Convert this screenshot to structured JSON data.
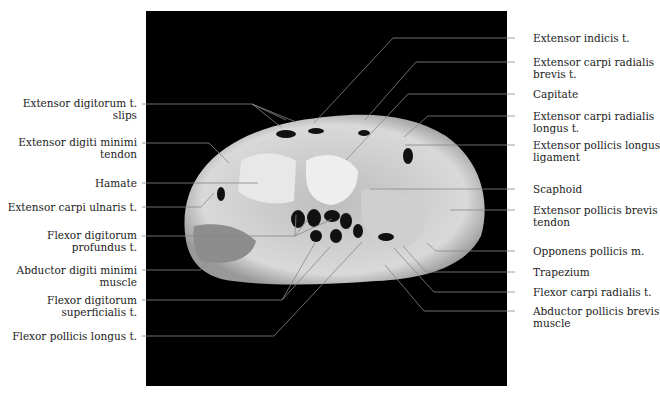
{
  "figure": {
    "type": "axial MRI of wrist (carpal level)",
    "left_labels": [
      {
        "line1": "Extensor digitorum t.",
        "line2": "slips"
      },
      {
        "line1": "Extensor digiti minimi",
        "line2": "tendon"
      },
      {
        "line1": "Hamate",
        "line2": ""
      },
      {
        "line1": "Extensor carpi ulnaris t.",
        "line2": ""
      },
      {
        "line1": "Flexor digitorum",
        "line2": "profundus t."
      },
      {
        "line1": "Abductor digiti minimi",
        "line2": "muscle"
      },
      {
        "line1": "Flexor digitorum",
        "line2": "superficialis t."
      },
      {
        "line1": "Flexor pollicis longus t.",
        "line2": ""
      }
    ],
    "right_labels": [
      {
        "line1": "Extensor indicis t.",
        "line2": ""
      },
      {
        "line1": "Extensor carpi radialis",
        "line2": "brevis t."
      },
      {
        "line1": "Capitate",
        "line2": ""
      },
      {
        "line1": "Extensor carpi radialis",
        "line2": "longus t."
      },
      {
        "line1": "Extensor pollicis longus",
        "line2": "ligament"
      },
      {
        "line1": "Scaphoid",
        "line2": ""
      },
      {
        "line1": "Extensor pollicis brevis",
        "line2": "tendon"
      },
      {
        "line1": "Opponens pollicis m.",
        "line2": ""
      },
      {
        "line1": "Trapezium",
        "line2": ""
      },
      {
        "line1": "Flexor carpi radialis t.",
        "line2": ""
      },
      {
        "line1": "Abductor pollicis brevis",
        "line2": "muscle"
      }
    ]
  }
}
